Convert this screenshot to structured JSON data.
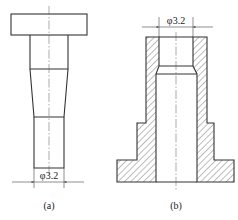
{
  "figure_a": {
    "label": "(a)",
    "dimension": {
      "symbol": "φ",
      "value": "3.2",
      "text": "φ3.2"
    }
  },
  "figure_b": {
    "label": "(b)",
    "dimension": {
      "symbol": "φ",
      "value": "3.2",
      "text": "φ3.2"
    }
  },
  "colors": {
    "line": "#333333",
    "background": "#ffffff"
  }
}
